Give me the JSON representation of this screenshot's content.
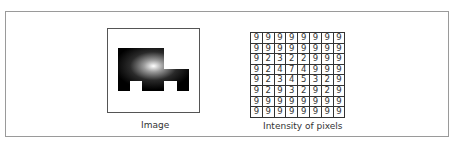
{
  "figure": {
    "image_caption": "Image",
    "grid_caption": "Intensity of pixels",
    "pixel_grid": [
      [
        9,
        9,
        9,
        9,
        9,
        9,
        9,
        9
      ],
      [
        9,
        9,
        9,
        9,
        9,
        9,
        9,
        9
      ],
      [
        9,
        2,
        3,
        2,
        2,
        9,
        9,
        9
      ],
      [
        9,
        2,
        4,
        7,
        4,
        9,
        9,
        9
      ],
      [
        9,
        2,
        3,
        4,
        5,
        3,
        2,
        9
      ],
      [
        9,
        2,
        9,
        3,
        2,
        9,
        2,
        9
      ],
      [
        9,
        9,
        9,
        9,
        9,
        9,
        9,
        9
      ],
      [
        9,
        9,
        9,
        9,
        9,
        9,
        9,
        9
      ]
    ],
    "colors": {
      "shape_dark": "#000000",
      "shape_highlight": "#ffffff",
      "border": "#555555"
    }
  }
}
